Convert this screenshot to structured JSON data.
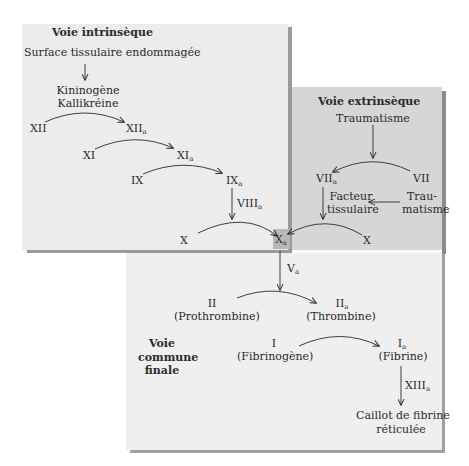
{
  "panels": {
    "intrinsic": {
      "title": "Voie intrinsèque",
      "trigger": "Surface tissulaire endommagée",
      "cofactor_line1": "Kininogène",
      "cofactor_line2": "Kallikréine",
      "factors": {
        "xii": "XII",
        "xiia": "XII",
        "xi": "XI",
        "xia": "XI",
        "ix": "IX",
        "ixa": "IX",
        "viiia": "VIII",
        "x": "X"
      }
    },
    "extrinsic": {
      "title": "Voie extrinsèque",
      "trigger": "Traumatisme",
      "vii": "VII",
      "viia": "VII",
      "tissue_factor_line1": "Facteur",
      "tissue_factor_line2": "tissulaire",
      "trauma_line1": "Trau-",
      "trauma_line2": "matisme",
      "x": "X"
    },
    "common": {
      "title_line1": "Voie",
      "title_line2": "commune",
      "title_line3": "finale",
      "xa": "X",
      "va": "V",
      "ii": "II",
      "ii_name": "(Prothrombine)",
      "iia": "II",
      "iia_name": "(Thrombine)",
      "i": "I",
      "i_name": "(Fibrinogène)",
      "ia": "I",
      "ia_name": "(Fibrine)",
      "xiiia": "XIII",
      "clot_line1": "Caillot de fibrine",
      "clot_line2": "réticulée"
    }
  },
  "activated_subscript": "a",
  "colors": {
    "intrinsic_bg": "#ececec",
    "extrinsic_bg": "#d6d6d6",
    "common_bg": "#efefef",
    "xa_box": "#b8b8b8",
    "shadow": "#9a9a9a",
    "text": "#2a2a2a"
  }
}
